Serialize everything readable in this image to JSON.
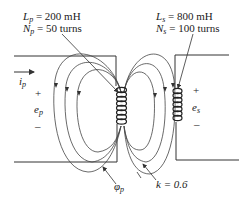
{
  "primary": {
    "inductance_symbol": "L",
    "inductance_sub": "p",
    "inductance_value": "= 200 mH",
    "turns_symbol": "N",
    "turns_sub": "p",
    "turns_value": "= 50 turns",
    "current_symbol": "i",
    "current_sub": "p",
    "voltage_symbol": "e",
    "voltage_sub": "p",
    "plus": "+",
    "minus": "–"
  },
  "secondary": {
    "inductance_symbol": "L",
    "inductance_sub": "s",
    "inductance_value": "= 800 mH",
    "turns_symbol": "N",
    "turns_sub": "s",
    "turns_value": "= 100 turns",
    "voltage_symbol": "e",
    "voltage_sub": "s",
    "plus": "+",
    "minus": "–"
  },
  "flux": {
    "symbol": "φ",
    "sub": "p"
  },
  "coupling": {
    "label": "k = 0.6"
  },
  "colors": {
    "line": "#333333",
    "text": "#222222",
    "background": "#ffffff"
  }
}
